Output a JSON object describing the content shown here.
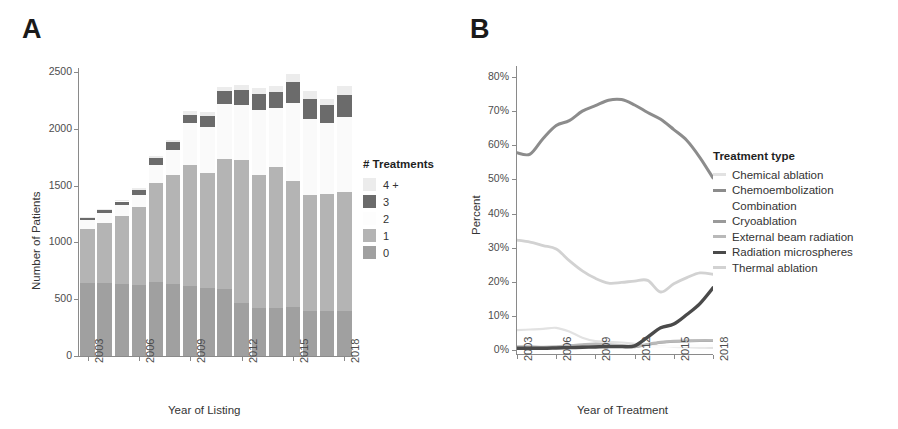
{
  "figure": {
    "panel_a_label": "A",
    "panel_b_label": "B"
  },
  "panelA": {
    "ylabel": "Number of Patients",
    "xlabel": "Year of Listing",
    "legend_title": "# Treatments"
  },
  "panelB": {
    "ylabel": "Percent",
    "xlabel": "Year of Treatment",
    "legend_title": "Treatment type"
  },
  "chart_data": [
    {
      "type": "bar",
      "id": "panel-a",
      "title": "A",
      "xlabel": "Year of Listing",
      "ylabel": "Number of Patients",
      "ylim": [
        0,
        2600
      ],
      "ytick_values": [
        0,
        500,
        1000,
        1500,
        2000,
        2500
      ],
      "ytick_labels": [
        "0",
        "500",
        "1000",
        "1500",
        "2000",
        "2500"
      ],
      "grid": false,
      "stacked": true,
      "legend_title": "# Treatments",
      "legend_position": "right",
      "categories": [
        2003,
        2004,
        2005,
        2006,
        2007,
        2008,
        2009,
        2010,
        2011,
        2012,
        2013,
        2014,
        2015,
        2016,
        2017,
        2018
      ],
      "xtick_labels": [
        "2003",
        "2006",
        "2009",
        "2012",
        "2015",
        "2018"
      ],
      "xtick_categories": [
        2003,
        2006,
        2009,
        2012,
        2015,
        2018
      ],
      "series": [
        {
          "name": "0",
          "color": "#a0a0a0",
          "values": [
            640,
            640,
            630,
            625,
            650,
            630,
            615,
            600,
            590,
            470,
            420,
            420,
            430,
            400,
            395,
            400
          ]
        },
        {
          "name": "1",
          "color": "#b4b4b4",
          "values": [
            475,
            530,
            605,
            690,
            870,
            960,
            1065,
            1010,
            1140,
            1255,
            1170,
            1240,
            1110,
            1020,
            1030,
            1045
          ]
        },
        {
          "name": "2",
          "color": "#fafafa",
          "values": [
            80,
            85,
            90,
            105,
            165,
            225,
            370,
            405,
            490,
            485,
            575,
            520,
            690,
            670,
            630,
            660
          ]
        },
        {
          "name": "3",
          "color": "#6b6b6b",
          "values": [
            25,
            28,
            35,
            45,
            55,
            65,
            75,
            95,
            110,
            130,
            140,
            145,
            180,
            175,
            155,
            195
          ]
        },
        {
          "name": "4 +",
          "color": "#ececec",
          "values": [
            5,
            8,
            10,
            12,
            18,
            22,
            28,
            35,
            40,
            45,
            55,
            52,
            70,
            68,
            55,
            75
          ]
        }
      ],
      "legend_entries": [
        {
          "label": "4 +",
          "color": "#ececec"
        },
        {
          "label": "3",
          "color": "#6b6b6b"
        },
        {
          "label": "2",
          "color": "#fdfdfd"
        },
        {
          "label": "1",
          "color": "#b4b4b4"
        },
        {
          "label": "0",
          "color": "#a0a0a0"
        }
      ]
    },
    {
      "type": "line",
      "id": "panel-b",
      "title": "B",
      "xlabel": "Year of Treatment",
      "ylabel": "Percent",
      "ylim": [
        0,
        84
      ],
      "xlim": [
        2003,
        2018
      ],
      "ytick_values": [
        0,
        10,
        20,
        30,
        40,
        50,
        60,
        70,
        80
      ],
      "ytick_labels": [
        "0%",
        "10%",
        "20%",
        "30%",
        "40%",
        "50%",
        "60%",
        "70%",
        "80%"
      ],
      "xtick_values": [
        2003,
        2006,
        2009,
        2012,
        2015,
        2018
      ],
      "xtick_labels": [
        "2003",
        "2006",
        "2009",
        "2012",
        "2015",
        "2018"
      ],
      "grid": false,
      "legend_title": "Treatment type",
      "legend_position": "right",
      "x": [
        2003,
        2004,
        2005,
        2006,
        2007,
        2008,
        2009,
        2010,
        2011,
        2012,
        2013,
        2014,
        2015,
        2016,
        2017,
        2018
      ],
      "series": [
        {
          "name": "Chemical ablation",
          "color": "#e2e2e2",
          "width": 2.2,
          "values": [
            5.8,
            6.0,
            6.2,
            6.5,
            5.4,
            3.6,
            2.6,
            2.4,
            2.2,
            1.8,
            1.4,
            1.1,
            0.9,
            0.8,
            0.7,
            0.6
          ]
        },
        {
          "name": "Chemoembolization",
          "color": "#8c8c8c",
          "width": 3.0,
          "values": [
            57.8,
            57.4,
            62.0,
            65.8,
            67.2,
            70.0,
            71.6,
            73.2,
            73.4,
            71.8,
            69.6,
            67.6,
            64.6,
            61.4,
            56.4,
            50.4
          ]
        },
        {
          "name": "Combination",
          "color": "#fcfcfc",
          "width": 2.6,
          "values": [
            0.4,
            0.4,
            0.5,
            0.5,
            0.6,
            0.6,
            0.7,
            0.8,
            0.8,
            0.9,
            1.0,
            1.0,
            1.1,
            1.2,
            1.2,
            1.3
          ]
        },
        {
          "name": "Cryoablation",
          "color": "#9a9a9a",
          "width": 2.6,
          "values": [
            0.8,
            0.8,
            0.7,
            0.8,
            1.2,
            1.4,
            1.5,
            1.3,
            1.2,
            0.9,
            1.6,
            2.2,
            2.5,
            2.6,
            2.7,
            2.7
          ]
        },
        {
          "name": "External beam radiation",
          "color": "#b9b9b9",
          "width": 2.6,
          "values": [
            1.0,
            1.0,
            0.9,
            1.0,
            1.3,
            1.6,
            1.8,
            1.6,
            1.4,
            1.0,
            1.7,
            2.3,
            2.6,
            2.7,
            2.8,
            2.8
          ]
        },
        {
          "name": "Radiation microspheres",
          "color": "#4a4a4a",
          "width": 3.4,
          "values": [
            0.5,
            0.5,
            0.5,
            0.6,
            0.7,
            0.8,
            0.9,
            1.0,
            1.0,
            1.2,
            3.8,
            6.5,
            7.6,
            10.4,
            13.6,
            18.2
          ]
        },
        {
          "name": "Thermal ablation",
          "color": "#d2d2d2",
          "width": 2.8,
          "values": [
            32.2,
            31.6,
            30.6,
            29.6,
            26.2,
            23.2,
            21.0,
            19.6,
            19.8,
            20.2,
            20.4,
            17.0,
            19.4,
            21.2,
            22.6,
            22.2
          ]
        }
      ],
      "legend_entries": [
        {
          "label": "Chemical ablation",
          "color": "#e2e2e2"
        },
        {
          "label": "Chemoembolization",
          "color": "#8c8c8c"
        },
        {
          "label": "Combination",
          "color": "#ffffff"
        },
        {
          "label": "Cryoablation",
          "color": "#9a9a9a"
        },
        {
          "label": "External beam radiation",
          "color": "#b9b9b9"
        },
        {
          "label": "Radiation microspheres",
          "color": "#4a4a4a"
        },
        {
          "label": "Thermal ablation",
          "color": "#d2d2d2"
        }
      ]
    }
  ]
}
